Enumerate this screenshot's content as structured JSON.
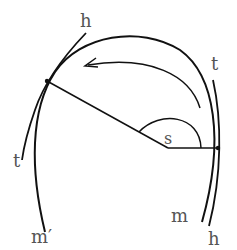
{
  "diagram": {
    "labels": {
      "h_top": "h",
      "t_top_right": "t",
      "t_left": "t",
      "s_angle": "s",
      "m_prime": "m′",
      "m": "m",
      "h_bottom": "h"
    },
    "colors": {
      "stroke": "#111111",
      "label": "#555555",
      "background": "#ffffff"
    }
  }
}
